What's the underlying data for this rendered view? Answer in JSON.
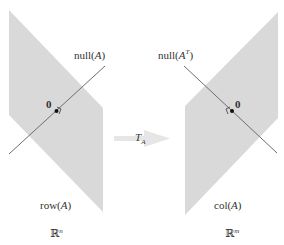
{
  "diagram": {
    "left": {
      "space_symbol": "ℝ",
      "space_superscript": "n",
      "subspace_label": "row(A)",
      "subspace_prefix": "row(",
      "subspace_var": "A",
      "subspace_suffix": ")",
      "line_label_prefix": "null(",
      "line_label_var": "A",
      "line_label_suffix": ")",
      "origin_label": "0"
    },
    "right": {
      "space_symbol": "ℝ",
      "space_superscript": "m",
      "subspace_prefix": "col(",
      "subspace_var": "A",
      "subspace_suffix": ")",
      "line_label_prefix": "null(",
      "line_label_var": "A",
      "line_label_sup": "T",
      "line_label_suffix": ")",
      "origin_label": "0"
    },
    "arrow": {
      "label_var": "T",
      "label_sub": "A"
    },
    "colors": {
      "plane_fill": "#d9d9d9",
      "line": "#666666",
      "arrow": "#e6e6e6",
      "text": "#333333"
    }
  }
}
